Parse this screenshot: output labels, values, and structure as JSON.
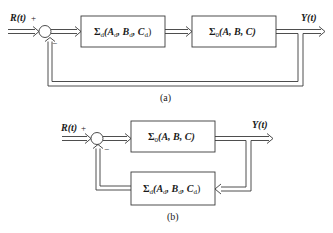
{
  "diagram_a": {
    "caption": "(a)",
    "input_label": "R(t)",
    "plus_sign": "+",
    "minus_sign": "−",
    "output_label": "Y(t)",
    "block_1": {
      "name": "Σ",
      "sub": "d",
      "args": "(A",
      "a_sub": "d",
      "b": ", B",
      "b_sub": "d",
      "c": ", C",
      "c_sub": "d",
      "close": ")"
    },
    "block_2": {
      "name": "Σ",
      "sub": "0",
      "args": "(A, B, C)"
    }
  },
  "diagram_b": {
    "caption": "(b)",
    "input_label": "R(t)",
    "plus_sign": "+",
    "minus_sign": "−",
    "output_label": "Y(t)",
    "block_forward": {
      "name": "Σ",
      "sub": "0",
      "args": "(A, B, C)"
    },
    "block_feedback": {
      "name": "Σ",
      "sub": "d",
      "args": "(A",
      "a_sub": "d",
      "b": ", B",
      "b_sub": "d",
      "c": ", C",
      "c_sub": "d",
      "close": ")"
    }
  },
  "colors": {
    "line": "#3a3a3a",
    "text": "#1a1a1a",
    "background": "#ffffff"
  }
}
